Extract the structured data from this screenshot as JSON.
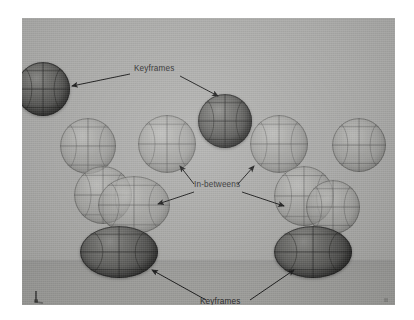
{
  "scene": {
    "kind": "3d-animation-viewport",
    "description": "Bouncing ball animation arc showing keyframes and in-betweens",
    "colors": {
      "page_background": "#ffffff",
      "wall": "#b2b2b0",
      "ground": "#a0a09d",
      "keyframe_ball": "#5e5e5c",
      "inbetween_ball": "#9b9b98",
      "annotation_text": "#2b2b2b",
      "arrow": "#1a1a1a",
      "wireframe": "#4a4a48"
    },
    "viewport": {
      "x": 22,
      "y": 18,
      "width": 373,
      "height": 287,
      "horizon_y": 242
    }
  },
  "annotations": [
    {
      "id": "keyframes-top",
      "label": "Keyframes",
      "x": 112,
      "y": 51,
      "arrow_count": 2
    },
    {
      "id": "in-betweens",
      "label": "In-betweens",
      "x": 178,
      "y": 166,
      "arrow_count": 4
    },
    {
      "id": "keyframes-bottom",
      "label": "Keyframes",
      "x": 186,
      "y": 285,
      "arrow_count": 2
    }
  ],
  "balls": [
    {
      "id": "keyframe-1",
      "role": "keyframe",
      "shape": "sphere",
      "x": -6,
      "y": 44,
      "w": 54,
      "h": 54,
      "tone": "dark"
    },
    {
      "id": "inbetween-1",
      "role": "in-between",
      "shape": "sphere",
      "x": 38,
      "y": 100,
      "w": 56,
      "h": 56,
      "tone": "light"
    },
    {
      "id": "inbetween-2",
      "role": "in-between",
      "shape": "sphere",
      "x": 116,
      "y": 97,
      "w": 58,
      "h": 58,
      "tone": "light"
    },
    {
      "id": "keyframe-2",
      "role": "keyframe",
      "shape": "sphere",
      "x": 176,
      "y": 76,
      "w": 54,
      "h": 54,
      "tone": "dark"
    },
    {
      "id": "inbetween-3",
      "role": "in-between",
      "shape": "sphere",
      "x": 228,
      "y": 97,
      "w": 58,
      "h": 58,
      "tone": "light"
    },
    {
      "id": "keyframe-3",
      "role": "keyframe",
      "shape": "sphere",
      "x": 310,
      "y": 100,
      "w": 54,
      "h": 54,
      "tone": "light"
    },
    {
      "id": "inbetween-4",
      "role": "in-between",
      "shape": "sphere",
      "x": 52,
      "y": 148,
      "w": 58,
      "h": 58,
      "tone": "light"
    },
    {
      "id": "inbetween-5",
      "role": "in-between",
      "shape": "ellipse",
      "x": 76,
      "y": 158,
      "w": 72,
      "h": 58,
      "tone": "light"
    },
    {
      "id": "inbetween-6",
      "role": "in-between",
      "shape": "sphere",
      "x": 252,
      "y": 148,
      "w": 60,
      "h": 60,
      "tone": "light"
    },
    {
      "id": "inbetween-7",
      "role": "in-between",
      "shape": "sphere",
      "x": 284,
      "y": 162,
      "w": 54,
      "h": 54,
      "tone": "light"
    },
    {
      "id": "keyframe-4",
      "role": "keyframe",
      "shape": "squash",
      "x": 58,
      "y": 208,
      "w": 78,
      "h": 52,
      "tone": "dark"
    },
    {
      "id": "keyframe-5",
      "role": "keyframe",
      "shape": "squash",
      "x": 252,
      "y": 208,
      "w": 78,
      "h": 52,
      "tone": "dark"
    }
  ],
  "gizmo": {
    "name": "axis-gizmo",
    "label": ""
  }
}
